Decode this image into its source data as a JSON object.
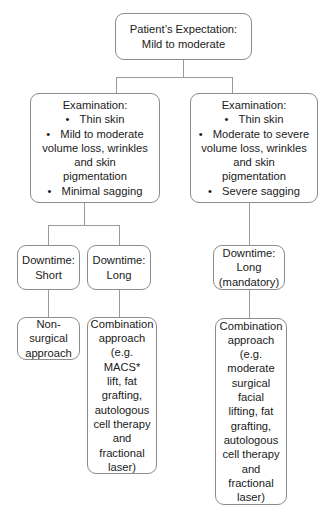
{
  "root": {
    "title": "Patient’s Expectation:",
    "subtitle": "Mild to moderate"
  },
  "branches": [
    {
      "examination": {
        "heading": "Examination:",
        "bullets": [
          {
            "lines": [
              "Thin skin"
            ]
          },
          {
            "lines": [
              "Mild to moderate",
              "volume loss, wrinkles",
              "and skin",
              "pigmentation"
            ]
          },
          {
            "lines": [
              "Minimal sagging"
            ]
          }
        ]
      },
      "downtimes": [
        {
          "label": "Downtime:",
          "value": "Short",
          "outcome": {
            "lines": [
              "Non-surgical",
              "approach"
            ]
          }
        },
        {
          "label": "Downtime:",
          "value": "Long",
          "outcome": {
            "lines": [
              "Combination",
              "approach",
              "(e.g. MACS*",
              "lift, fat",
              "grafting,",
              "autologous",
              "cell therapy",
              "and",
              "fractional",
              "laser)"
            ]
          }
        }
      ]
    },
    {
      "examination": {
        "heading": "Examination:",
        "bullets": [
          {
            "lines": [
              "Thin skin"
            ]
          },
          {
            "lines": [
              "Moderate to severe",
              "volume loss, wrinkles",
              "and skin",
              "pigmentation"
            ]
          },
          {
            "lines": [
              "Severe sagging"
            ]
          }
        ]
      },
      "downtimes": [
        {
          "label": "Downtime:",
          "value": "Long",
          "value2": "(mandatory)",
          "outcome": {
            "lines": [
              "Combination",
              "approach",
              "(e.g.",
              "moderate",
              "surgical facial",
              "lifting, fat",
              "grafting,",
              "autologous",
              "cell therapy",
              "and",
              "fractional",
              "laser)"
            ]
          }
        }
      ]
    }
  ],
  "bullet_glyph": "•",
  "colors": {
    "border": "#8c8c8c",
    "connector": "#9a9a9a",
    "text": "#1a1a1a",
    "background": "#ffffff"
  }
}
